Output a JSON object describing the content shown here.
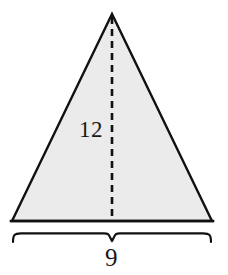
{
  "figure": {
    "kind": "geometry-diagram",
    "shape": "isosceles-triangle",
    "alt": "Isosceles triangle with dashed height 12 and base 9",
    "colors": {
      "background": "#ffffff",
      "fill": "#ebebeb",
      "outline": "#111111",
      "dashed_line": "#111111",
      "brace": "#111111",
      "text": "#191919"
    },
    "triangle": {
      "apex": {
        "x": 112,
        "y": 14
      },
      "bottom_left": {
        "x": 12,
        "y": 221
      },
      "bottom_right": {
        "x": 212,
        "y": 221
      },
      "outline_width": 2.4
    },
    "height_line": {
      "from": {
        "x": 112,
        "y": 16
      },
      "to": {
        "x": 112,
        "y": 221
      },
      "style": "dashed",
      "dash": "7 5",
      "width": 2.6
    },
    "brace": {
      "left_x": 12,
      "right_x": 212,
      "top_y": 233,
      "center_x": 112,
      "notch_y": 241,
      "tip_drop": 9,
      "width": 2.2
    }
  },
  "labels": {
    "height": "12",
    "base": "9"
  }
}
